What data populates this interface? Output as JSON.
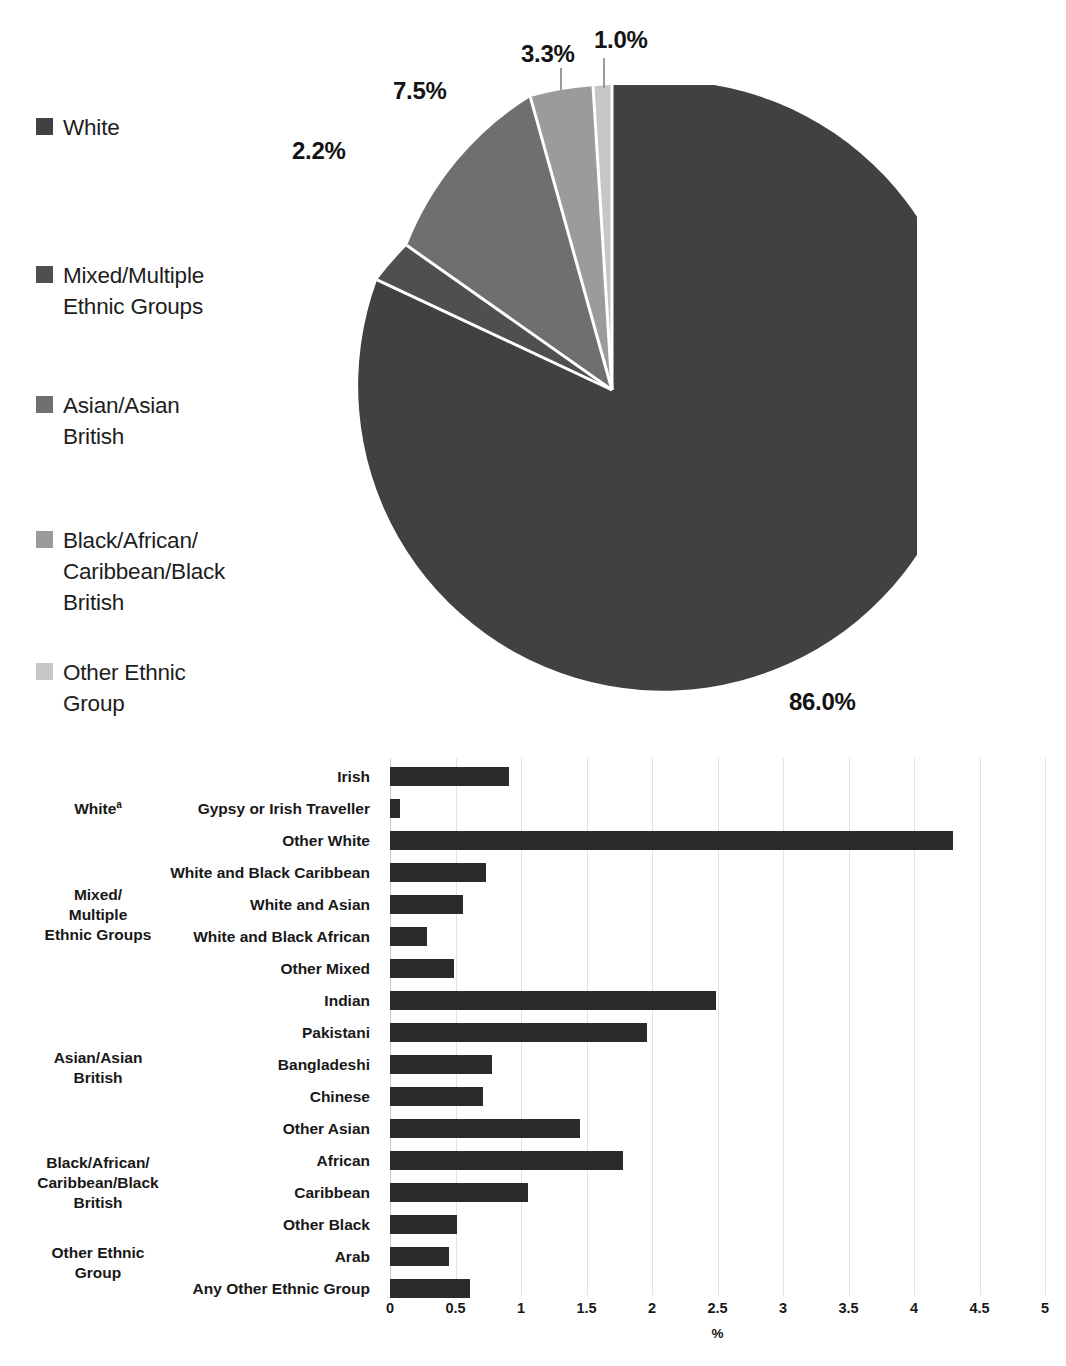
{
  "chart_data": [
    {
      "type": "pie",
      "title": "",
      "legend_position": "left",
      "categories": [
        "White",
        "Mixed/Multiple Ethnic Groups",
        "Asian/Asian British",
        "Black/African/Caribbean/Black British",
        "Other Ethnic Group"
      ],
      "values": [
        86.0,
        2.2,
        7.5,
        3.3,
        1.0
      ],
      "value_labels": [
        "86.0%",
        "2.2%",
        "7.5%",
        "3.3%",
        "1.0%"
      ],
      "colors": [
        "#414141",
        "#4f4f4f",
        "#6f6f6f",
        "#9b9b9b",
        "#c6c6c6"
      ],
      "units": "%"
    },
    {
      "type": "bar",
      "orientation": "horizontal",
      "title": "",
      "xlabel": "%",
      "ylabel": "",
      "xlim": [
        0,
        5
      ],
      "xticks": [
        "0",
        "0.5",
        "1",
        "1.5",
        "2",
        "2.5",
        "3",
        "3.5",
        "4",
        "4.5",
        "5"
      ],
      "grid": true,
      "bar_color": "#2b2b2b",
      "categories": [
        "Irish",
        "Gypsy or Irish Traveller",
        "Other White",
        "White and Black Caribbean",
        "White and Asian",
        "White and Black African",
        "Other Mixed",
        "Indian",
        "Pakistani",
        "Bangladeshi",
        "Chinese",
        "Other Asian",
        "African",
        "Caribbean",
        "Other Black",
        "Arab",
        "Any Other Ethnic Group"
      ],
      "values": [
        0.91,
        0.08,
        4.3,
        0.73,
        0.56,
        0.28,
        0.49,
        2.49,
        1.96,
        0.78,
        0.71,
        1.45,
        1.78,
        1.05,
        0.51,
        0.45,
        0.61
      ],
      "groups": [
        {
          "label": "White",
          "superscript": "a",
          "first": 0,
          "last": 2
        },
        {
          "label": "Mixed/ Multiple Ethnic Groups",
          "lines": [
            "Mixed/",
            "Multiple",
            "Ethnic Groups"
          ],
          "first": 3,
          "last": 6
        },
        {
          "label": "Asian/Asian British",
          "lines": [
            "Asian/Asian",
            "British"
          ],
          "first": 7,
          "last": 11
        },
        {
          "label": "Black/African/ Caribbean/Black British",
          "lines": [
            "Black/African/",
            "Caribbean/Black",
            "British"
          ],
          "first": 12,
          "last": 14
        },
        {
          "label": "Other Ethnic Group",
          "lines": [
            "Other Ethnic",
            "Group"
          ],
          "first": 15,
          "last": 16
        }
      ]
    }
  ],
  "pie": {
    "legend": [
      {
        "label": "White",
        "lines": [
          "White"
        ],
        "color": "#414141"
      },
      {
        "label": "Mixed/Multiple Ethnic Groups",
        "lines": [
          "Mixed/Multiple",
          "Ethnic Groups"
        ],
        "color": "#4f4f4f"
      },
      {
        "label": "Asian/Asian British",
        "lines": [
          "Asian/Asian",
          "British"
        ],
        "color": "#6f6f6f"
      },
      {
        "label": "Black/African/Caribbean/Black British",
        "lines": [
          "Black/African/",
          "Caribbean/Black",
          "British"
        ],
        "color": "#9b9b9b"
      },
      {
        "label": "Other Ethnic Group",
        "lines": [
          "Other Ethnic",
          "Group"
        ],
        "color": "#c6c6c6"
      }
    ],
    "labels": {
      "white": "86.0%",
      "mixed": "2.2%",
      "asian": "7.5%",
      "black": "3.3%",
      "other": "1.0%"
    }
  },
  "bar": {
    "x_axis_title": "%"
  }
}
